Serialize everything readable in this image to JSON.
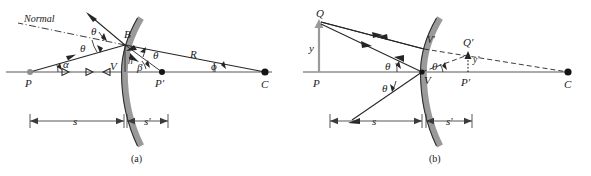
{
  "figure": {
    "panels": [
      {
        "id": "a",
        "caption": "(a)",
        "labels": {
          "normal": "Normal",
          "theta_incident": "θ",
          "theta_reflected": "θ",
          "theta_center": "θ",
          "alpha": "α",
          "beta": "β",
          "phi": "ϕ",
          "point_B": "B",
          "point_P": "P",
          "point_P_prime": "P′",
          "point_C": "C",
          "point_V": "V",
          "height_h": "h",
          "radius_R": "R",
          "dim_s": "s",
          "dim_s_prime": "s′"
        }
      },
      {
        "id": "b",
        "caption": "(b)",
        "labels": {
          "point_Q": "Q",
          "point_Q_prime": "Q′",
          "point_P": "P",
          "point_P_prime": "P′",
          "point_V": "V",
          "point_V_prime": "V′",
          "point_C": "C",
          "object_height_y": "y",
          "image_height_y_prime": "y′",
          "theta_upper": "θ",
          "theta_lower": "θ",
          "theta_right": "θ",
          "dim_s": "s",
          "dim_s_prime": "s′"
        }
      }
    ],
    "colors": {
      "ray": "#262626",
      "axis": "#8e8e8e",
      "mirror": "#9a9a9a",
      "background": "#ffffff",
      "point_dark": "#141414",
      "point_gray": "#8e8e8e"
    }
  }
}
